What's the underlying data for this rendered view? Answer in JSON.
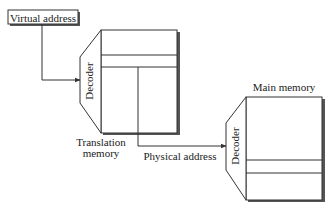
{
  "diagram": {
    "type": "memory-address-translation",
    "colors": {
      "stroke": "#333333",
      "shadow": "#555555",
      "background": "#ffffff",
      "text": "#222222"
    },
    "virtual_address": {
      "label": "Virtual address"
    },
    "translation_memory": {
      "label_line1": "Translation",
      "label_line2": "memory",
      "decoder_label": "Decoder"
    },
    "physical_address": {
      "label": "Physical address"
    },
    "main_memory": {
      "label": "Main memory",
      "decoder_label": "Decoder"
    },
    "edges": [
      {
        "from": "virtual_address",
        "to": "translation_memory_decoder"
      },
      {
        "from": "translation_memory",
        "to": "main_memory_decoder",
        "label": "Physical address"
      }
    ]
  }
}
